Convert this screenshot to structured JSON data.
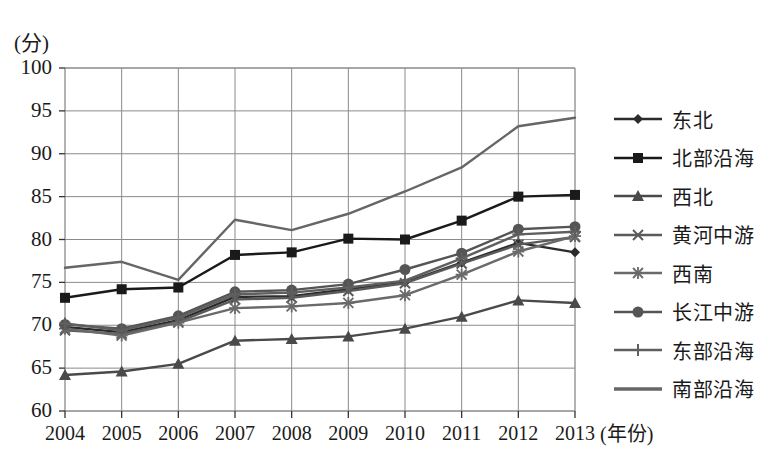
{
  "chart_data": {
    "type": "line",
    "title": "",
    "ylabel": "(分)",
    "xlabel": "(年份)",
    "x": [
      "2004",
      "2005",
      "2006",
      "2007",
      "2008",
      "2009",
      "2010",
      "2011",
      "2012",
      "2013"
    ],
    "ylim": [
      60,
      100
    ],
    "yticks": [
      "60",
      "65",
      "70",
      "75",
      "80",
      "85",
      "90",
      "95",
      "100"
    ],
    "grid": true,
    "legend_position": "right",
    "series": [
      {
        "name": "东北",
        "marker": "diamond",
        "color": "#2b2b2b",
        "values": [
          69.8,
          69.2,
          70.6,
          73.3,
          73.4,
          74.2,
          75.0,
          77.3,
          79.6,
          78.5
        ]
      },
      {
        "name": "北部沿海",
        "marker": "square",
        "color": "#1a1a1a",
        "values": [
          73.2,
          74.2,
          74.4,
          78.2,
          78.5,
          80.1,
          80.0,
          82.2,
          85.0,
          85.2
        ]
      },
      {
        "name": "西北",
        "marker": "triangle",
        "color": "#4a4a4a",
        "values": [
          64.2,
          64.6,
          65.5,
          68.2,
          68.4,
          68.7,
          69.6,
          71.0,
          72.9,
          72.6
        ]
      },
      {
        "name": "黄河中游",
        "marker": "cross",
        "color": "#5a5a5a",
        "values": [
          69.4,
          69.0,
          70.4,
          73.0,
          73.2,
          74.0,
          74.9,
          77.2,
          79.4,
          80.3
        ]
      },
      {
        "name": "西南",
        "marker": "star",
        "color": "#6a6a6a",
        "values": [
          69.6,
          68.8,
          70.3,
          72.0,
          72.2,
          72.6,
          73.5,
          75.9,
          78.6,
          80.4
        ]
      },
      {
        "name": "长江中游",
        "marker": "circle",
        "color": "#555555",
        "values": [
          70.1,
          69.6,
          71.1,
          73.9,
          74.1,
          74.8,
          76.5,
          78.4,
          81.2,
          81.5
        ]
      },
      {
        "name": "东部沿海",
        "marker": "plus",
        "color": "#5f5f5f",
        "values": [
          70.2,
          69.4,
          70.9,
          73.6,
          73.8,
          74.4,
          75.2,
          77.8,
          80.6,
          80.9
        ]
      },
      {
        "name": "南部沿海",
        "marker": "none",
        "color": "#666666",
        "values": [
          76.7,
          77.4,
          75.3,
          82.3,
          81.1,
          83.0,
          85.6,
          88.4,
          93.2,
          94.2
        ]
      }
    ]
  },
  "axes": {
    "y_unit": "(分)",
    "x_title": "(年份)"
  }
}
